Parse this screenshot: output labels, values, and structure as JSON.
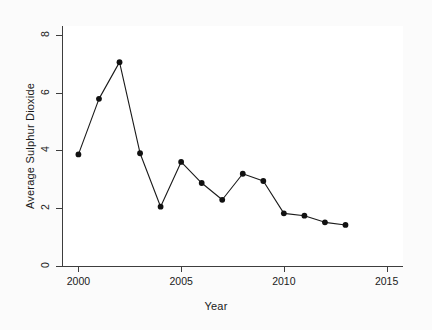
{
  "chart_data": {
    "type": "line",
    "title": "",
    "xlabel": "Year",
    "ylabel": "Average Sulphur Dioxide",
    "x": [
      2000,
      2001,
      2002,
      2003,
      2004,
      2005,
      2006,
      2007,
      2008,
      2009,
      2010,
      2011,
      2012,
      2013
    ],
    "values": [
      3.86,
      5.78,
      7.05,
      3.9,
      2.05,
      3.6,
      2.87,
      2.29,
      3.19,
      2.94,
      1.82,
      1.74,
      1.51,
      1.42
    ],
    "series": [
      {
        "name": "Average Sulphur Dioxide",
        "values": [
          3.86,
          5.78,
          7.05,
          3.9,
          2.05,
          3.6,
          2.87,
          2.29,
          3.19,
          2.94,
          1.82,
          1.74,
          1.51,
          1.42
        ]
      }
    ],
    "xlim": [
      1999.2,
      2015.8
    ],
    "ylim": [
      0,
      8.3
    ],
    "xticks": [
      2000,
      2005,
      2010,
      2015
    ],
    "xtick_labels": [
      "2000",
      "2005",
      "2010",
      "2015"
    ],
    "yticks": [
      0,
      2,
      4,
      6,
      8
    ],
    "ytick_labels": [
      "0",
      "2",
      "4",
      "6",
      "8"
    ],
    "grid": false,
    "legend": null,
    "marker": "filled-circle",
    "line_color": "#1a1a1a",
    "marker_color": "#1a1a1a",
    "background_color": "#ffffff",
    "figure_background_color": "#fbfbfb"
  }
}
